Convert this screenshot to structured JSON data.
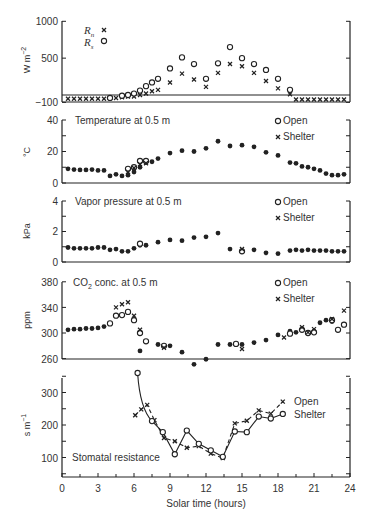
{
  "chart_data": [
    {
      "type": "scatter",
      "title": "",
      "xlabel": "Solar time (hours)",
      "ylabel": "W m^-2",
      "ylim": [
        -100,
        1000
      ],
      "yticks": [
        "1000",
        "500",
        "−100"
      ],
      "legend": [
        {
          "name": "R_n",
          "marker": "x"
        },
        {
          "name": "R_s",
          "marker": "o"
        }
      ],
      "series": [
        {
          "name": "R_n",
          "x": [
            0.5,
            1,
            1.5,
            2,
            2.5,
            3,
            3.5,
            4,
            4.5,
            5,
            5.5,
            6,
            6.5,
            7,
            7.5,
            8,
            9,
            10,
            11,
            12,
            13,
            14,
            15,
            16,
            17,
            18,
            19,
            19.5,
            20,
            20.5,
            21,
            21.5,
            22,
            22.5,
            23,
            23.5
          ],
          "y": [
            -50,
            -50,
            -50,
            -50,
            -50,
            -50,
            -50,
            -40,
            -40,
            -30,
            -20,
            -20,
            0,
            20,
            50,
            70,
            170,
            290,
            210,
            110,
            300,
            420,
            390,
            300,
            190,
            90,
            10,
            -60,
            -60,
            -60,
            -60,
            -60,
            -60,
            -60,
            -60,
            -60
          ]
        },
        {
          "name": "R_s",
          "x": [
            4,
            5,
            5.5,
            6,
            6.5,
            7,
            7.5,
            8,
            9,
            10,
            11,
            12,
            13,
            14,
            15,
            16,
            17,
            18,
            19
          ],
          "y": [
            -40,
            -10,
            0,
            20,
            60,
            120,
            170,
            220,
            360,
            510,
            420,
            220,
            430,
            650,
            500,
            420,
            340,
            220,
            70,
            0
          ]
        }
      ]
    },
    {
      "type": "scatter",
      "title": "Temperature at 0.5 m",
      "ylabel": "°C",
      "ylim": [
        0,
        40
      ],
      "yticks": [
        "40",
        "20",
        "0"
      ],
      "legend": [
        {
          "name": "Open",
          "marker": "o"
        },
        {
          "name": "Shelter",
          "marker": "x"
        }
      ],
      "series": [
        {
          "name": "Open/Shelter (coincident)",
          "x": [
            0.5,
            1,
            1.5,
            2,
            2.5,
            3,
            3.5,
            4,
            4.5,
            5,
            5.5,
            6,
            6.5,
            7,
            7.5,
            8,
            9,
            10,
            11,
            12,
            13,
            14,
            15,
            16,
            17,
            18,
            19,
            19.5,
            20,
            20.5,
            21,
            21.5,
            22,
            22.5,
            23,
            23.5
          ],
          "y": [
            9,
            8.5,
            8.3,
            8.3,
            8.5,
            8,
            8,
            4.5,
            5.5,
            4.5,
            5,
            7,
            10,
            13,
            13.5,
            15.5,
            19,
            20.5,
            20,
            22,
            26.5,
            23.5,
            24,
            23,
            19.5,
            17.5,
            13,
            12.5,
            10.5,
            10,
            9,
            8,
            6,
            5,
            5,
            5.5
          ]
        },
        {
          "name": "Open",
          "x": [
            5.5,
            6,
            6.5,
            7
          ],
          "y": [
            9,
            10,
            14,
            14
          ]
        },
        {
          "name": "Shelter",
          "x": [
            5.5,
            6,
            6.5,
            7
          ],
          "y": [
            7,
            9.5,
            12,
            12.5
          ]
        }
      ]
    },
    {
      "type": "scatter",
      "title": "Vapor pressure at 0.5 m",
      "ylabel": "kPa",
      "ylim": [
        0,
        4
      ],
      "yticks": [
        "4",
        "2",
        "0"
      ],
      "legend": [
        {
          "name": "Open",
          "marker": "o"
        },
        {
          "name": "Shelter",
          "marker": "x"
        }
      ],
      "series": [
        {
          "name": "Open/Shelter (coincident)",
          "x": [
            0.5,
            1,
            1.5,
            2,
            2.5,
            3,
            3.5,
            4,
            4.5,
            5,
            5.5,
            6,
            6.5,
            7,
            8,
            9,
            10,
            11,
            12,
            13,
            14,
            15,
            16,
            17,
            18,
            19,
            19.5,
            20,
            20.5,
            21,
            21.5,
            22,
            22.5,
            23,
            23.5
          ],
          "y": [
            0.95,
            0.9,
            0.9,
            0.9,
            0.9,
            0.95,
            0.95,
            0.8,
            0.85,
            0.7,
            0.7,
            0.9,
            1.1,
            1.1,
            1.3,
            1.45,
            1.4,
            1.6,
            1.65,
            1.9,
            0.85,
            0.75,
            0.8,
            0.6,
            0.55,
            0.75,
            0.8,
            0.75,
            0.8,
            0.75,
            0.75,
            0.75,
            0.7,
            0.7,
            0.7
          ]
        },
        {
          "name": "Open",
          "x": [
            6.5,
            15
          ],
          "y": [
            1.2,
            0.7
          ]
        },
        {
          "name": "Shelter",
          "x": [
            15
          ],
          "y": [
            0.85
          ]
        }
      ]
    },
    {
      "type": "scatter",
      "title": "CO2 conc. at 0.5 m",
      "ylabel": "ppm",
      "ylim": [
        260,
        380
      ],
      "yticks": [
        "380",
        "340",
        "300",
        "260"
      ],
      "legend": [
        {
          "name": "Open",
          "marker": "o"
        },
        {
          "name": "Shelter",
          "marker": "x"
        }
      ],
      "series": [
        {
          "name": "Open/Shelter (coincident)",
          "x": [
            0.5,
            1,
            1.5,
            2,
            2.5,
            3,
            3.5,
            6.5,
            7,
            8,
            9,
            10,
            11,
            12,
            13,
            14,
            15,
            16,
            17,
            18,
            19,
            19.5,
            20,
            20.5,
            21,
            21.5,
            22,
            22.5,
            23,
            23.5
          ],
          "y": [
            305,
            306,
            306,
            307,
            307,
            308,
            310,
            272,
            287,
            282,
            280,
            270,
            251,
            259,
            282,
            282,
            282,
            285,
            289,
            297,
            303,
            301,
            306,
            300,
            303,
            316,
            320,
            318,
            305,
            313
          ]
        },
        {
          "name": "Open",
          "x": [
            4,
            4.5,
            5,
            5.5,
            6,
            6.5,
            7,
            8.5,
            14.5,
            19,
            20,
            20.5,
            21,
            22.5,
            23,
            23.5
          ],
          "y": [
            315,
            327,
            328,
            333,
            320,
            300,
            287,
            280,
            283,
            299,
            305,
            300,
            301,
            320,
            305,
            313
          ]
        },
        {
          "name": "Shelter",
          "x": [
            4.5,
            5,
            5.5,
            6,
            6.5,
            8.5,
            15,
            18.5,
            20,
            20.5,
            21,
            22.5,
            23.5
          ],
          "y": [
            340,
            345,
            348,
            327,
            305,
            277,
            275,
            293,
            309,
            301,
            306,
            322,
            335
          ]
        }
      ]
    },
    {
      "type": "line",
      "title": "Stomatal resistance",
      "ylabel": "s m^-1",
      "xlabel": "Solar time (hours)",
      "ylim": [
        40,
        360
      ],
      "yticks": [
        "300",
        "200",
        "100"
      ],
      "xticks": [
        "0",
        "3",
        "6",
        "9",
        "12",
        "15",
        "18",
        "21",
        "24"
      ],
      "legend": [
        {
          "name": "Open",
          "marker": "x",
          "style": "dashed"
        },
        {
          "name": "Shelter",
          "marker": "o",
          "style": "solid"
        }
      ],
      "series": [
        {
          "name": "Open",
          "x": [
            6.1,
            6.6,
            7.1,
            7.7,
            8.5,
            9.4,
            10.4,
            11.4,
            12.4,
            13.4,
            14.4,
            15.4,
            16.4,
            17.4,
            18.4
          ],
          "y": [
            230,
            248,
            262,
            215,
            160,
            150,
            130,
            135,
            112,
            98,
            205,
            213,
            245,
            235,
            272
          ]
        },
        {
          "name": "Shelter",
          "x": [
            6.3,
            7.5,
            8.4,
            9.4,
            10.4,
            11.4,
            12.4,
            13.4,
            14.4,
            15.4,
            16.4,
            17.4,
            18.4
          ],
          "y": [
            360,
            212,
            178,
            110,
            183,
            142,
            122,
            102,
            180,
            178,
            226,
            220,
            234
          ]
        }
      ]
    }
  ],
  "panels": {
    "p1": {
      "ylabel": "W m",
      "ylabel_sup": "−2",
      "ticks": [
        "1000",
        "500",
        "−100"
      ],
      "legend": [
        {
          "label": "R",
          "sub": "n"
        },
        {
          "label": "R",
          "sub": "s"
        }
      ]
    },
    "p2": {
      "title": "Temperature at 0.5 m",
      "ylabel": "°C",
      "ticks": [
        "40",
        "20",
        "0"
      ],
      "legend": [
        "Open",
        "Shelter"
      ]
    },
    "p3": {
      "title": "Vapor pressure at 0.5 m",
      "ylabel": "kPa",
      "ticks": [
        "4",
        "2",
        "0"
      ],
      "legend": [
        "Open",
        "Shelter"
      ]
    },
    "p4": {
      "title_pre": "CO",
      "title_sub": "2",
      "title_post": " conc. at 0.5 m",
      "ylabel": "ppm",
      "ticks": [
        "380",
        "340",
        "300",
        "260"
      ],
      "legend": [
        "Open",
        "Shelter"
      ]
    },
    "p5": {
      "title": "Stomatal resistance",
      "ylabel": "s m",
      "ylabel_sup": "−1",
      "ticks": [
        "300",
        "200",
        "100"
      ],
      "legend": [
        "Open",
        "Shelter"
      ]
    }
  },
  "xaxis": {
    "label": "Solar time (hours)",
    "ticks": [
      "0",
      "3",
      "6",
      "9",
      "12",
      "15",
      "18",
      "21",
      "24"
    ]
  }
}
